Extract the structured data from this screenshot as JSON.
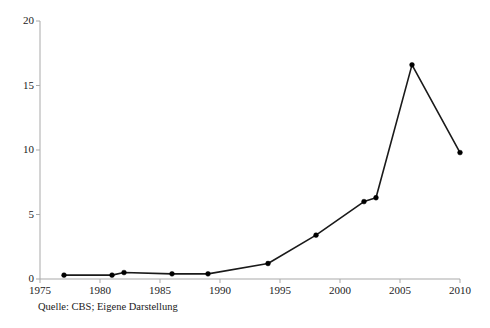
{
  "figure": {
    "caption": "Quelle: CBS; Eigene Darstellung",
    "title_fragment": "",
    "background_color": "#ffffff",
    "line_color": "#1a1a1a",
    "marker_color": "#000000",
    "axis_color": "#a9a9a9"
  },
  "chart_data": {
    "type": "line",
    "title": "",
    "xlabel": "",
    "ylabel": "",
    "xlim": [
      1975,
      2010
    ],
    "ylim": [
      0,
      20
    ],
    "grid": false,
    "legend": "none",
    "xticks": [
      "1975",
      "1980",
      "1985",
      "1990",
      "1995",
      "2000",
      "2005",
      "2010"
    ],
    "xtick_values": [
      1975,
      1980,
      1985,
      1990,
      1995,
      2000,
      2005,
      2010
    ],
    "yticks": [
      "0",
      "5",
      "10",
      "15",
      "20"
    ],
    "ytick_values": [
      0,
      5,
      10,
      15,
      20
    ],
    "series": [
      {
        "name": "series-1",
        "x": [
          1977,
          1981,
          1982,
          1986,
          1989,
          1994,
          1998,
          2002,
          2003,
          2006,
          2010
        ],
        "values": [
          0.3,
          0.3,
          0.5,
          0.4,
          0.4,
          1.2,
          3.4,
          6.0,
          6.3,
          16.6,
          9.8
        ]
      }
    ]
  }
}
